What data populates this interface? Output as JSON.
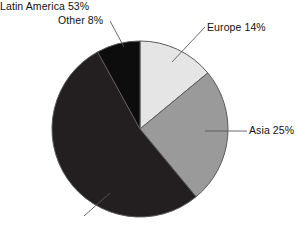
{
  "chart_data": {
    "type": "pie",
    "title": "",
    "subtitle": "",
    "xlabel": "",
    "ylabel": "",
    "legend_position": "none",
    "grid": false,
    "labels_outside": true,
    "total_percent": 100,
    "start_angle_deg": 0,
    "direction": "clockwise",
    "categories": [
      "Europe",
      "Asia",
      "Latin America",
      "Other"
    ],
    "values": [
      14,
      25,
      53,
      8
    ],
    "slices": [
      {
        "name": "Europe",
        "value": 14,
        "label": "Europe 14%",
        "color": "#e5e5e5",
        "start_deg": 0,
        "end_deg": 50.4
      },
      {
        "name": "Asia",
        "value": 25,
        "label": "Asia 25%",
        "color": "#9a9a9a",
        "start_deg": 50.4,
        "end_deg": 140.4
      },
      {
        "name": "Latin America",
        "value": 53,
        "label": "Latin America 53%",
        "color": "#231f20",
        "start_deg": 140.4,
        "end_deg": 331.2
      },
      {
        "name": "Other",
        "value": 8,
        "label": "Other 8%",
        "color": "#0d0d0d",
        "start_deg": 331.2,
        "end_deg": 360
      }
    ]
  },
  "labels": {
    "other": "Other 8%",
    "europe": "Europe 14%",
    "asia": "Asia 25%",
    "latin_america": "Latin America 53%"
  },
  "colors": {
    "background": "#ffffff",
    "outline": "#5a5a5a",
    "leader_line": "#5a5a5a",
    "text": "#111111",
    "europe": "#e5e5e5",
    "asia": "#9a9a9a",
    "latin_america": "#231f20",
    "other": "#0d0d0d"
  }
}
